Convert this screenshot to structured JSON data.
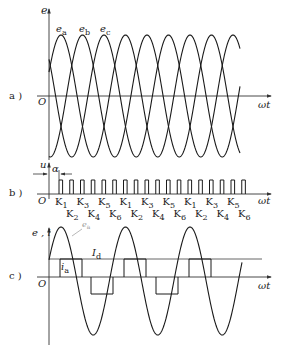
{
  "figure": {
    "panels": [
      {
        "id": "a",
        "label": "a )",
        "y_axis_label": "e",
        "x_axis_label": "ωt",
        "origin_label": "O",
        "curve_labels": [
          {
            "base": "e",
            "sub": "a"
          },
          {
            "base": "e",
            "sub": "b"
          },
          {
            "base": "e",
            "sub": "c"
          }
        ]
      },
      {
        "id": "b",
        "label": "b )",
        "y_axis_label": "u",
        "x_axis_label": "ωt",
        "origin_label": "O",
        "angle_label": "α",
        "pulse_count": 18,
        "switch_labels_top": [
          {
            "base": "K",
            "sub": "1"
          },
          {
            "base": "K",
            "sub": "3"
          },
          {
            "base": "K",
            "sub": "5"
          },
          {
            "base": "K",
            "sub": "1"
          },
          {
            "base": "K",
            "sub": "3"
          },
          {
            "base": "K",
            "sub": "5"
          },
          {
            "base": "K",
            "sub": "1"
          },
          {
            "base": "K",
            "sub": "3"
          },
          {
            "base": "K",
            "sub": "5"
          }
        ],
        "switch_labels_bottom": [
          {
            "base": "K",
            "sub": "2"
          },
          {
            "base": "K",
            "sub": "4"
          },
          {
            "base": "K",
            "sub": "6"
          },
          {
            "base": "K",
            "sub": "2"
          },
          {
            "base": "K",
            "sub": "4"
          },
          {
            "base": "K",
            "sub": "6"
          },
          {
            "base": "K",
            "sub": "2"
          },
          {
            "base": "K",
            "sub": "4"
          },
          {
            "base": "K",
            "sub": "6"
          }
        ]
      },
      {
        "id": "c",
        "label": "c )",
        "y_axis_label": "e , i",
        "x_axis_label": "ωt",
        "origin_label": "O",
        "curve_label": {
          "base": "e",
          "sub": "a"
        },
        "dc_label": {
          "base": "I",
          "sub": "d"
        },
        "current_label": {
          "base": "i",
          "sub": "a"
        }
      }
    ],
    "colors": {
      "line": "#1a1a1a",
      "axis": "#333333",
      "grid_line": "#555555"
    }
  }
}
